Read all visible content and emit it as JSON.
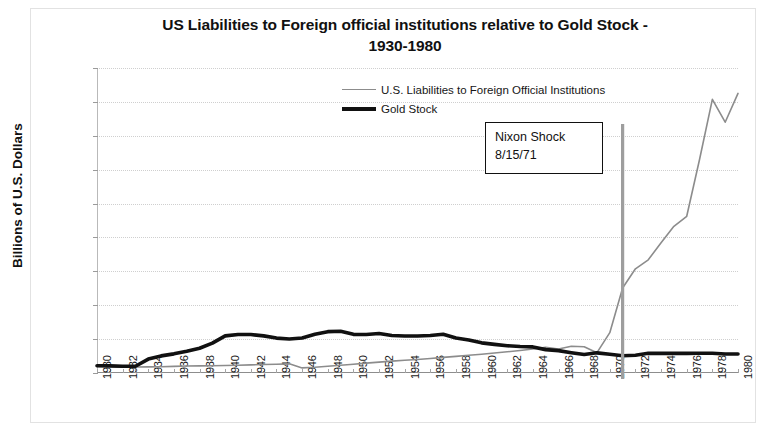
{
  "chart_data": {
    "type": "line",
    "title": "US Liabilities to Foreign official institutions relative to Gold Stock - 1930-1980",
    "title_line1": "US Liabilities to Foreign official institutions relative to Gold Stock -",
    "title_line2": "1930-1980",
    "xlabel": "",
    "ylabel": "Billions of U.S. Dollars",
    "ylim": [
      0,
      180000
    ],
    "xlim": [
      1930,
      1980
    ],
    "ytick_labels": [
      "180000",
      "160000",
      "140000",
      "120000",
      "100000",
      "80000",
      "60000",
      "40000",
      "20000",
      "0"
    ],
    "ytick_values": [
      180000,
      160000,
      140000,
      120000,
      100000,
      80000,
      60000,
      40000,
      20000,
      0
    ],
    "xtick_labels": [
      "1930",
      "1932",
      "1934",
      "1936",
      "1938",
      "1940",
      "1942",
      "1944",
      "1946",
      "1948",
      "1950",
      "1952",
      "1954",
      "1956",
      "1958",
      "1960",
      "1962",
      "1964",
      "1966",
      "1968",
      "1970",
      "1972",
      "1974",
      "1976",
      "1978",
      "1980"
    ],
    "grid": true,
    "legend_position": "top-center",
    "x": [
      1930,
      1931,
      1932,
      1933,
      1934,
      1935,
      1936,
      1937,
      1938,
      1939,
      1940,
      1941,
      1942,
      1943,
      1944,
      1945,
      1946,
      1947,
      1948,
      1949,
      1950,
      1951,
      1952,
      1953,
      1954,
      1955,
      1956,
      1957,
      1958,
      1959,
      1960,
      1961,
      1962,
      1963,
      1964,
      1965,
      1966,
      1967,
      1968,
      1969,
      1970,
      1971,
      1972,
      1973,
      1974,
      1975,
      1976,
      1977,
      1978,
      1979,
      1980
    ],
    "series": [
      {
        "name": "U.S. Liabilities to Foreign Official Institutions",
        "color": "#8c8c8c",
        "width": 1.6,
        "values": [
          4000,
          3800,
          3600,
          3500,
          3600,
          3700,
          3900,
          4100,
          4200,
          4300,
          4400,
          4600,
          4800,
          5000,
          5200,
          5400,
          3000,
          3400,
          4000,
          4600,
          5200,
          5800,
          6400,
          7000,
          7500,
          8000,
          8600,
          9200,
          9800,
          10500,
          11100,
          11800,
          12500,
          13300,
          14200,
          15200,
          14200,
          15800,
          15500,
          12000,
          23800,
          50200,
          61500,
          66800,
          76900,
          86600,
          92500,
          126000,
          161500,
          148000,
          165000
        ]
      },
      {
        "name": "Gold Stock",
        "color": "#111111",
        "width": 3.6,
        "values": [
          4300,
          4200,
          4000,
          4000,
          8200,
          10100,
          11300,
          12800,
          14600,
          17600,
          21900,
          22700,
          22700,
          21900,
          20600,
          20100,
          20700,
          22900,
          24400,
          24600,
          22800,
          22700,
          23300,
          22100,
          21800,
          21800,
          22100,
          22900,
          20600,
          19500,
          17800,
          16900,
          16100,
          15600,
          15400,
          13800,
          13200,
          12000,
          10900,
          11900,
          11100,
          10200,
          10500,
          11600,
          11600,
          11600,
          11600,
          11700,
          11700,
          11200,
          11200
        ]
      }
    ],
    "annotations": [
      {
        "name": "nixon-shock",
        "line1": "Nixon Shock",
        "line2": "8/15/71",
        "vline_year": 1971
      }
    ]
  }
}
